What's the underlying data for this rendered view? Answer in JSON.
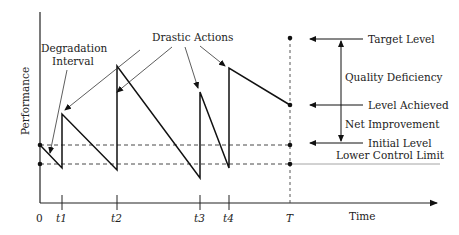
{
  "diagram": {
    "axes": {
      "y_label": "Performance",
      "x_label": "Time",
      "x_ticks": [
        "0",
        "t1",
        "t2",
        "t3",
        "t4",
        "T"
      ]
    },
    "annotations": {
      "drastic_actions": "Drastic Actions",
      "degradation_line1": "Degradation",
      "degradation_line2": "Interval",
      "target_level": "Target Level",
      "quality_deficiency": "Quality Deficiency",
      "level_achieved": "Level Achieved",
      "net_improvement": "Net Improvement",
      "initial_level": "Initial Level",
      "lower_control_limit": "Lower Control Limit"
    },
    "colors": {
      "line": "#1a1a1a",
      "limit_line": "#9a9a9a"
    }
  }
}
